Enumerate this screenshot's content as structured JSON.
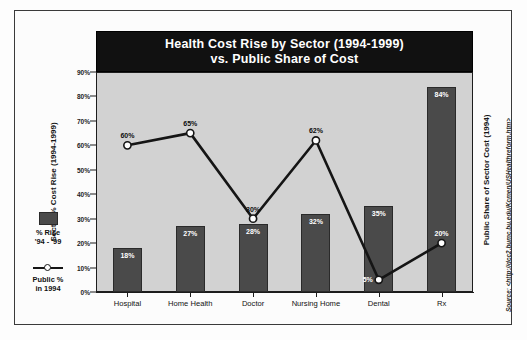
{
  "chart_data": {
    "type": "bar",
    "title": "Health Cost Rise by Sector (1994-1999) vs. Public Share of Cost",
    "title_lines": [
      "Health Cost Rise by Sector (1994-1999)",
      "vs. Public Share of Cost"
    ],
    "categories": [
      "Hospital",
      "Home Health",
      "Doctor",
      "Nursing Home",
      "Dental",
      "Rx"
    ],
    "series": [
      {
        "name": "% Rise '94 - '99",
        "type": "bar",
        "axis": "left",
        "values": [
          18,
          27,
          28,
          32,
          35,
          84
        ],
        "labels": [
          "18%",
          "27%",
          "28%",
          "32%",
          "35%",
          "84%"
        ],
        "color": "#4a4a4a"
      },
      {
        "name": "Public % in 1994",
        "type": "line",
        "axis": "right",
        "values": [
          60,
          65,
          30,
          62,
          5,
          20
        ],
        "labels": [
          "60%",
          "65%",
          "30%",
          "62%",
          "5%",
          "20%"
        ],
        "color": "#151515",
        "marker": "circle-open"
      }
    ],
    "ylabel": "Sector % Cost Rise (1994-1999)",
    "y2label": "Public Share of Sector Cost (1994)",
    "xlabel": "",
    "ylim": [
      0,
      90
    ],
    "yticks": [
      0,
      10,
      20,
      30,
      40,
      50,
      60,
      70,
      80,
      90
    ],
    "ytick_labels": [
      "0%",
      "10%",
      "20%",
      "30%",
      "40%",
      "50%",
      "60%",
      "70%",
      "80%",
      "90%"
    ],
    "grid": false,
    "legend_position": "left-outside",
    "plot_background": "#d2d2d2",
    "title_background": "#111111",
    "title_color": "#ffffff"
  },
  "legend": {
    "bar_label_line1": "% Rise",
    "bar_label_line2": "'94 - '99",
    "line_label_line1": "Public %",
    "line_label_line2": "in 1994"
  },
  "source": {
    "text": "Source: <http://dcc2.bumc.bu.edu/Kcmen/USHealthreform.htm>"
  }
}
